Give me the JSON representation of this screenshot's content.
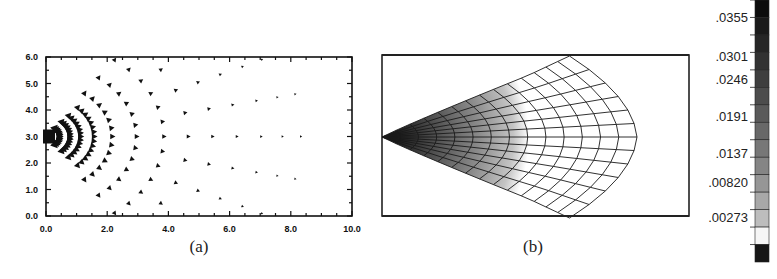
{
  "figure": {
    "panels": [
      {
        "id": "a",
        "label": "(a)",
        "type": "vector-field",
        "xlim": [
          0.0,
          10.0
        ],
        "ylim": [
          0.0,
          6.0
        ],
        "x_ticks": [
          "0.0",
          "2.0",
          "4.0",
          "6.0",
          "8.0",
          "10.0"
        ],
        "y_ticks": [
          "0.0",
          "1.0",
          "2.0",
          "3.0",
          "4.0",
          "5.0",
          "6.0"
        ],
        "source": {
          "x": 0.0,
          "y": 3.0
        },
        "arc_radii": [
          0.35,
          0.7,
          1.05,
          1.5,
          2.1,
          2.9,
          3.8,
          4.6,
          5.4,
          6.2,
          7.0,
          7.7,
          8.3
        ],
        "glyph": "triangle-arrow"
      },
      {
        "id": "b",
        "label": "(b)",
        "type": "deformed-mesh-contour",
        "mesh": {
          "radial_lines": 13,
          "arc_lines": 14
        }
      }
    ],
    "colorbar": {
      "labels": [
        ".0355",
        ".0301",
        ".0246",
        ".0191",
        ".0137",
        ".00820",
        ".00273"
      ],
      "bands": [
        "#0c0c0c",
        "#1a1a1a",
        "#262626",
        "#323232",
        "#3e3e3e",
        "#4c4c4c",
        "#5a5a5a",
        "#686868",
        "#777777",
        "#858585",
        "#969696",
        "#a8a8a8",
        "#bdbdbd",
        "#f6f6f6",
        "#161616"
      ]
    }
  },
  "chart_data": [
    {
      "type": "scatter",
      "title": "(a)",
      "description": "Velocity vector field radiating from source at (0.0, 3.0); arrows on concentric arcs with decreasing magnitude",
      "xlabel": "",
      "ylabel": "",
      "xlim": [
        0.0,
        10.0
      ],
      "ylim": [
        0.0,
        6.0
      ],
      "x_ticks": [
        0.0,
        2.0,
        4.0,
        6.0,
        8.0,
        10.0
      ],
      "y_ticks": [
        0.0,
        1.0,
        2.0,
        3.0,
        4.0,
        5.0,
        6.0
      ],
      "grid": false
    },
    {
      "type": "heatmap",
      "title": "(b)",
      "description": "Deformed fan-shaped mesh with shaded contour, highest near apex",
      "colorbar_ticks": [
        0.0355,
        0.0301,
        0.0246,
        0.0191,
        0.0137,
        0.0082,
        0.00273
      ]
    }
  ]
}
